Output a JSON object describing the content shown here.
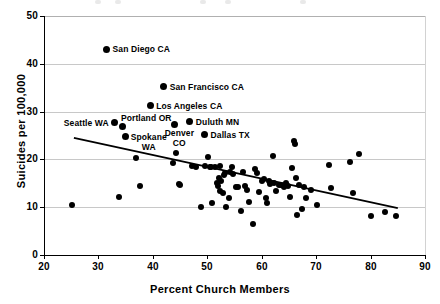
{
  "chart_data": {
    "type": "scatter",
    "title": "",
    "xlabel": "Percent Church Members",
    "ylabel": "Suicides per 100,000",
    "xlim": [
      20,
      90
    ],
    "ylim": [
      0,
      50
    ],
    "xticks": [
      20,
      30,
      40,
      50,
      60,
      70,
      80,
      90
    ],
    "yticks": [
      0,
      10,
      20,
      30,
      40,
      50
    ],
    "grid": "horizontal",
    "legend": "none",
    "marker": "filled-circle-black",
    "trendline": {
      "label": "linear fit",
      "x": [
        25.5,
        85.0
      ],
      "y": [
        24.5,
        9.8
      ]
    },
    "annotations": [
      {
        "label": "San Diego CA",
        "x": 31.5,
        "y": 43.0
      },
      {
        "label": "San Francisco CA",
        "x": 42.0,
        "y": 35.2
      },
      {
        "label": "Los Angeles CA",
        "x": 39.5,
        "y": 31.2
      },
      {
        "label": "Seattle WA",
        "x": 33.0,
        "y": 27.7
      },
      {
        "label": "Portland OR",
        "x": 34.5,
        "y": 26.8
      },
      {
        "label": "Spokane WA",
        "x": 35.0,
        "y": 24.8
      },
      {
        "label": "Denver CO",
        "x": 44.0,
        "y": 27.4
      },
      {
        "label": "Duluth MN",
        "x": 46.8,
        "y": 27.9
      },
      {
        "label": "Dallas TX",
        "x": 49.5,
        "y": 25.2
      }
    ],
    "points": [
      [
        31.5,
        43.0
      ],
      [
        42.0,
        35.2
      ],
      [
        39.5,
        31.2
      ],
      [
        33.0,
        27.7
      ],
      [
        34.5,
        26.8
      ],
      [
        35.0,
        24.8
      ],
      [
        44.0,
        27.4
      ],
      [
        46.8,
        27.9
      ],
      [
        49.5,
        25.2
      ],
      [
        25.2,
        10.4
      ],
      [
        33.8,
        12.1
      ],
      [
        36.9,
        20.4
      ],
      [
        37.6,
        14.5
      ],
      [
        43.6,
        19.2
      ],
      [
        44.2,
        21.4
      ],
      [
        44.8,
        14.8
      ],
      [
        45.0,
        14.6
      ],
      [
        47.2,
        18.6
      ],
      [
        48.0,
        18.5
      ],
      [
        48.8,
        10.0
      ],
      [
        49.6,
        18.6
      ],
      [
        50.1,
        20.6
      ],
      [
        50.4,
        18.5
      ],
      [
        50.6,
        18.4
      ],
      [
        50.9,
        10.9
      ],
      [
        51.4,
        18.5
      ],
      [
        51.8,
        15.0
      ],
      [
        52.0,
        14.4
      ],
      [
        52.1,
        16.1
      ],
      [
        52.3,
        13.5
      ],
      [
        52.4,
        18.7
      ],
      [
        52.6,
        15.5
      ],
      [
        52.8,
        12.9
      ],
      [
        53.1,
        16.8
      ],
      [
        53.3,
        17.1
      ],
      [
        53.5,
        10.0
      ],
      [
        53.9,
        11.9
      ],
      [
        54.2,
        17.3
      ],
      [
        54.5,
        18.4
      ],
      [
        54.7,
        16.9
      ],
      [
        55.2,
        14.2
      ],
      [
        55.6,
        14.3
      ],
      [
        56.1,
        9.2
      ],
      [
        56.5,
        17.4
      ],
      [
        56.9,
        14.4
      ],
      [
        57.2,
        13.7
      ],
      [
        57.6,
        11.0
      ],
      [
        58.4,
        6.6
      ],
      [
        58.8,
        17.9
      ],
      [
        59.1,
        17.2
      ],
      [
        59.5,
        13.2
      ],
      [
        60.1,
        15.4
      ],
      [
        60.4,
        15.9
      ],
      [
        60.8,
        11.9
      ],
      [
        61.0,
        10.8
      ],
      [
        61.3,
        15.4
      ],
      [
        61.6,
        14.9
      ],
      [
        62.0,
        20.8
      ],
      [
        62.2,
        15.0
      ],
      [
        62.6,
        13.4
      ],
      [
        63.1,
        14.6
      ],
      [
        63.6,
        14.7
      ],
      [
        64.0,
        14.2
      ],
      [
        64.4,
        15.0
      ],
      [
        64.8,
        14.5
      ],
      [
        65.2,
        12.2
      ],
      [
        65.6,
        18.2
      ],
      [
        65.9,
        23.8
      ],
      [
        66.1,
        23.2
      ],
      [
        66.3,
        16.1
      ],
      [
        66.5,
        8.4
      ],
      [
        66.9,
        14.6
      ],
      [
        67.4,
        9.6
      ],
      [
        67.8,
        14.3
      ],
      [
        68.2,
        12.0
      ],
      [
        69.0,
        13.6
      ],
      [
        70.2,
        10.5
      ],
      [
        72.3,
        18.8
      ],
      [
        72.8,
        14.0
      ],
      [
        76.2,
        19.4
      ],
      [
        76.7,
        12.9
      ],
      [
        77.8,
        21.1
      ],
      [
        80.1,
        8.2
      ],
      [
        82.6,
        9.0
      ],
      [
        84.7,
        8.1
      ]
    ]
  }
}
